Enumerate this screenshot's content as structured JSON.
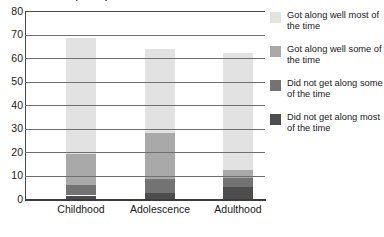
{
  "chart_data": {
    "type": "bar",
    "subtype": "stacked-vertical",
    "title": "Relationship with parents over time",
    "title_clipped": true,
    "xlabel": "",
    "ylabel": "",
    "ylim": [
      0,
      80
    ],
    "yticks": [
      0,
      10,
      20,
      30,
      40,
      50,
      60,
      70,
      80
    ],
    "ytick_labels": [
      "0",
      "10",
      "20",
      "30",
      "40",
      "50",
      "60",
      "70",
      "80"
    ],
    "grid": true,
    "grid_axis": "y",
    "legend_position": "right",
    "categories": [
      "Childhood",
      "Adolescence",
      "Adulthood"
    ],
    "series": [
      {
        "name": "Did not get along most of the time",
        "color": "#4d4d4d",
        "values": [
          1.5,
          2.5,
          5.0
        ]
      },
      {
        "name": "Did not get along some of the time",
        "color": "#737373",
        "values": [
          4.5,
          6.0,
          4.0
        ]
      },
      {
        "name": "Got along well some of the time",
        "color": "#a9a9a9",
        "values": [
          13.0,
          19.5,
          3.5
        ]
      },
      {
        "name": "Got along well most of the time",
        "color": "#e2e2e2",
        "values": [
          49.5,
          36.0,
          49.5
        ]
      }
    ],
    "stack_totals": [
      68.5,
      64.0,
      62.0
    ],
    "legend_order": [
      "Got along well most of the time",
      "Got along well some of the time",
      "Did not get along some of the time",
      "Did not get along most of the time"
    ]
  },
  "legend": {
    "items": [
      {
        "label": "Got along well most of the time",
        "color": "#e2e2e2",
        "swatch_name": "legend-swatch-got-along-well-most"
      },
      {
        "label": "Got along well some of the time",
        "color": "#a9a9a9",
        "swatch_name": "legend-swatch-got-along-well-some"
      },
      {
        "label": "Did not get along some of the time",
        "color": "#737373",
        "swatch_name": "legend-swatch-did-not-get-along-some"
      },
      {
        "label": "Did not get along most of the time",
        "color": "#4d4d4d",
        "swatch_name": "legend-swatch-did-not-get-along-most"
      }
    ]
  },
  "axes": {
    "y_tick_labels": [
      "80",
      "70",
      "60",
      "50",
      "40",
      "30",
      "20",
      "10",
      "0"
    ],
    "category_labels": [
      "Childhood",
      "Adolescence",
      "Adulthood"
    ]
  },
  "colors": {
    "axis": "#3c3c3c",
    "gridline": "#6f6f6f",
    "background": "#ffffff",
    "text": "#1a1a1a"
  }
}
